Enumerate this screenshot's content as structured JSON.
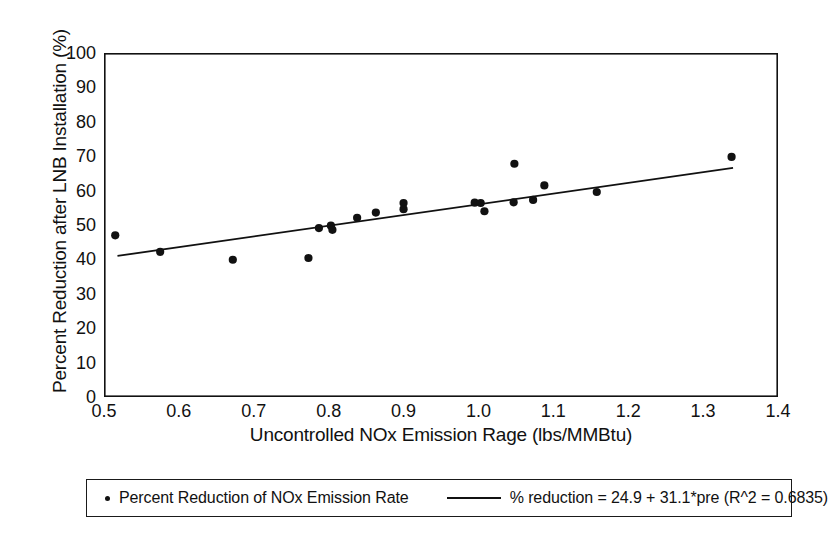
{
  "figure": {
    "background_color": "#ffffff",
    "ink_color": "#111111"
  },
  "legend": {
    "position": "below-axes",
    "entries": [
      {
        "marker": "dot-marker",
        "label": "Percent Reduction of NOx Emission Rate"
      },
      {
        "marker": "line-marker",
        "label": "% reduction = 24.9 + 31.1*pre (R^2 = 0.6835)"
      }
    ]
  },
  "caption": {
    "artifact_text": ""
  },
  "chart_data": {
    "type": "scatter",
    "title": "",
    "xlabel": "Uncontrolled NOx Emission Rage (lbs/MMBtu)",
    "ylabel": "Percent Reduction after LNB Installation (%)",
    "xlim": [
      0.5,
      1.4
    ],
    "ylim": [
      0,
      100
    ],
    "grid": false,
    "xticks": [
      0.5,
      0.6,
      0.7,
      0.8,
      0.9,
      1.0,
      1.1,
      1.2,
      1.3,
      1.4
    ],
    "xtick_labels": [
      "0.5",
      "0.6",
      "0.7",
      "0.8",
      "0.9",
      "1.0",
      "1.1",
      "1.2",
      "1.3",
      "1.4"
    ],
    "yticks": [
      0,
      10,
      20,
      30,
      40,
      50,
      60,
      70,
      80,
      90,
      100
    ],
    "ytick_labels": [
      "0",
      "10",
      "20",
      "30",
      "40",
      "50",
      "60",
      "70",
      "80",
      "90",
      "100"
    ],
    "series": [
      {
        "name": "Percent Reduction of NOx Emission Rate",
        "type": "scatter",
        "marker": "filled-circle",
        "color": "#111111",
        "points": [
          {
            "x": 0.515,
            "y": 47.0
          },
          {
            "x": 0.575,
            "y": 42.2
          },
          {
            "x": 0.672,
            "y": 39.9
          },
          {
            "x": 0.773,
            "y": 40.4
          },
          {
            "x": 0.787,
            "y": 49.1
          },
          {
            "x": 0.803,
            "y": 49.8
          },
          {
            "x": 0.805,
            "y": 48.6
          },
          {
            "x": 0.838,
            "y": 52.1
          },
          {
            "x": 0.863,
            "y": 53.6
          },
          {
            "x": 0.9,
            "y": 56.4
          },
          {
            "x": 0.9,
            "y": 54.6
          },
          {
            "x": 0.995,
            "y": 56.5
          },
          {
            "x": 1.003,
            "y": 56.4
          },
          {
            "x": 1.008,
            "y": 54.0
          },
          {
            "x": 1.048,
            "y": 67.8
          },
          {
            "x": 1.047,
            "y": 56.6
          },
          {
            "x": 1.073,
            "y": 57.3
          },
          {
            "x": 1.088,
            "y": 61.5
          },
          {
            "x": 1.158,
            "y": 59.6
          },
          {
            "x": 1.338,
            "y": 69.8
          }
        ]
      },
      {
        "name": "% reduction = 24.9 + 31.1*pre (R^2 = 0.6835)",
        "type": "line",
        "color": "#111111",
        "intercept": 24.9,
        "slope": 31.1,
        "r_squared": 0.6835,
        "x_start": 0.518,
        "x_end": 1.34,
        "y_start": 41.0,
        "y_end": 66.6
      }
    ]
  }
}
